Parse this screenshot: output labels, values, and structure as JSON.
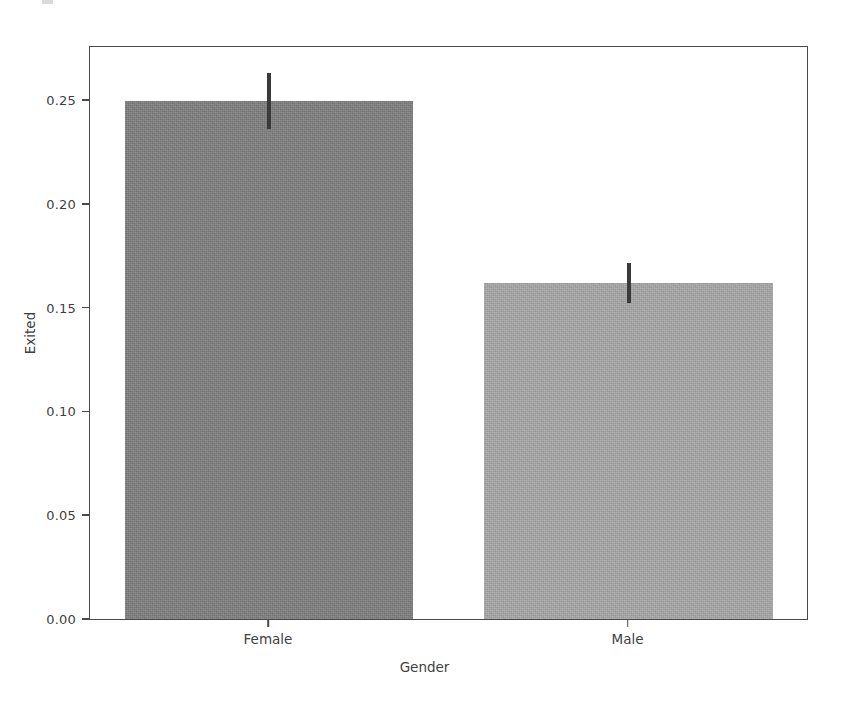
{
  "figure": {
    "width": 849,
    "height": 701,
    "background": "#ffffff",
    "frame_color": "#4a4a4a"
  },
  "chart_data": {
    "type": "bar",
    "title": "",
    "xlabel": "Gender",
    "ylabel": "Exited",
    "categories": [
      "Female",
      "Male"
    ],
    "values": [
      0.25,
      0.1624
    ],
    "errors": [
      0.0137,
      0.0096
    ],
    "error_type": "confidence-interval",
    "ylim": [
      0.0,
      0.2765
    ],
    "yticks": [
      0.0,
      0.05,
      0.1,
      0.15,
      0.2,
      0.25
    ],
    "ytick_labels": [
      "0.00",
      "0.05",
      "0.10",
      "0.15",
      "0.20",
      "0.25"
    ],
    "xtick_labels": [
      "Female",
      "Male"
    ],
    "grid": false,
    "legend": null,
    "bar_colors": [
      "#7f7f7f",
      "#a8a8a8"
    ],
    "error_bar_color": "#3a3a3a",
    "series": [
      {
        "name": "Exited",
        "points": [
          {
            "category": "Female",
            "value": 0.25,
            "error": 0.0137,
            "color": "#7f7f7f"
          },
          {
            "category": "Male",
            "value": 0.1624,
            "error": 0.0096,
            "color": "#a8a8a8"
          }
        ]
      }
    ]
  },
  "axes": {
    "y_ticks": [
      {
        "label": "0.00",
        "value": 0.0
      },
      {
        "label": "0.05",
        "value": 0.05
      },
      {
        "label": "0.10",
        "value": 0.1
      },
      {
        "label": "0.15",
        "value": 0.15
      },
      {
        "label": "0.20",
        "value": 0.2
      },
      {
        "label": "0.25",
        "value": 0.25
      }
    ],
    "x_ticks": [
      {
        "label": "Female"
      },
      {
        "label": "Male"
      }
    ],
    "x_title": "Gender",
    "y_title": "Exited"
  }
}
